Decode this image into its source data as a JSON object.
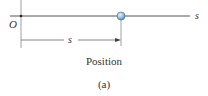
{
  "diagram": {
    "axis_label": "s",
    "origin_label": "O",
    "distance_label": "s",
    "caption": "Position",
    "sublabel": "(a)",
    "colors": {
      "line": "#555555",
      "particle_fill": "#9cc4e4",
      "particle_stroke": "#4a6f8f"
    }
  }
}
